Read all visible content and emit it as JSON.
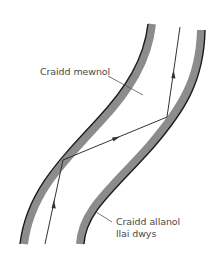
{
  "diagram": {
    "title": "",
    "labels": {
      "inner_core": "Craidd mewnol",
      "outer_cladding_line1": "Craidd allanol",
      "outer_cladding_line2": "llai dwys"
    },
    "colors": {
      "cladding_gray": "#8c8c8c",
      "edge_black": "#1a1a1a",
      "ray": "#333333",
      "leader": "#555555",
      "text": "#4a4a4a",
      "background": "#ffffff"
    },
    "elements": {
      "left_wall": "curved optical fibre wall (cladding) with dark outer edge",
      "right_wall": "curved optical fibre wall (cladding) with dark outer edge",
      "light_ray": "zig-zag ray reflecting off walls with direction arrows"
    }
  }
}
